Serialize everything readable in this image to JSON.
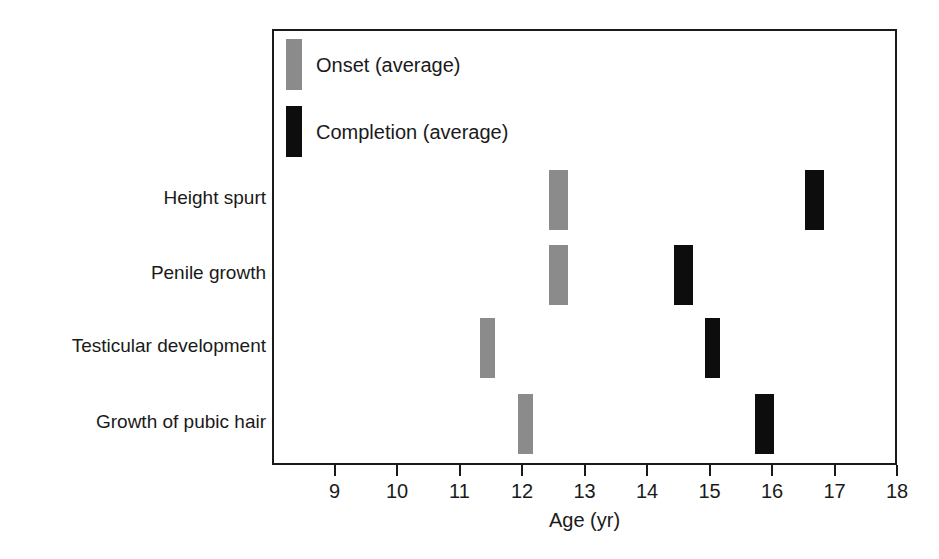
{
  "chart_data": {
    "type": "bar",
    "title": "",
    "subtitle": "",
    "xlabel": "Age (yr)",
    "ylabel": "",
    "xlim": [
      8.0,
      18.0
    ],
    "xticks": [
      9,
      10,
      11,
      12,
      13,
      14,
      15,
      16,
      17,
      18
    ],
    "xtick_labels": [
      "9",
      "10",
      "11",
      "12",
      "13",
      "14",
      "15",
      "16",
      "17",
      "18"
    ],
    "grid": false,
    "legend_position": "top-left",
    "legend": [
      {
        "name": "Onset (average)",
        "color": "#8b8b8b"
      },
      {
        "name": "Completion (average)",
        "color": "#0d0d0d"
      }
    ],
    "categories": [
      "Height spurt",
      "Penile growth",
      "Testicular development",
      "Growth of pubic hair"
    ],
    "series": [
      {
        "name": "Onset (average)",
        "color": "#8b8b8b",
        "ranges": [
          {
            "category": "Height spurt",
            "start": 12.4,
            "end": 12.7
          },
          {
            "category": "Penile growth",
            "start": 12.4,
            "end": 12.7
          },
          {
            "category": "Testicular development",
            "start": 11.3,
            "end": 11.5
          },
          {
            "category": "Growth of pubic hair",
            "start": 11.9,
            "end": 12.1
          }
        ]
      },
      {
        "name": "Completion (average)",
        "color": "#0d0d0d",
        "ranges": [
          {
            "category": "Height spurt",
            "start": 16.5,
            "end": 16.8
          },
          {
            "category": "Penile growth",
            "start": 14.4,
            "end": 14.7
          },
          {
            "category": "Testicular development",
            "start": 14.9,
            "end": 15.1
          },
          {
            "category": "Growth of pubic hair",
            "start": 15.7,
            "end": 16.0
          }
        ]
      }
    ]
  },
  "legend": {
    "onset_label": "Onset (average)",
    "completion_label": "Completion (average)"
  },
  "axis": {
    "title": "Age (yr)"
  },
  "categories": {
    "row0": "Height spurt",
    "row1": "Penile growth",
    "row2": "Testicular development",
    "row3": "Growth of pubic hair"
  },
  "ticks": {
    "t0": "9",
    "t1": "10",
    "t2": "11",
    "t3": "12",
    "t4": "13",
    "t5": "14",
    "t6": "15",
    "t7": "16",
    "t8": "17",
    "t9": "18"
  }
}
